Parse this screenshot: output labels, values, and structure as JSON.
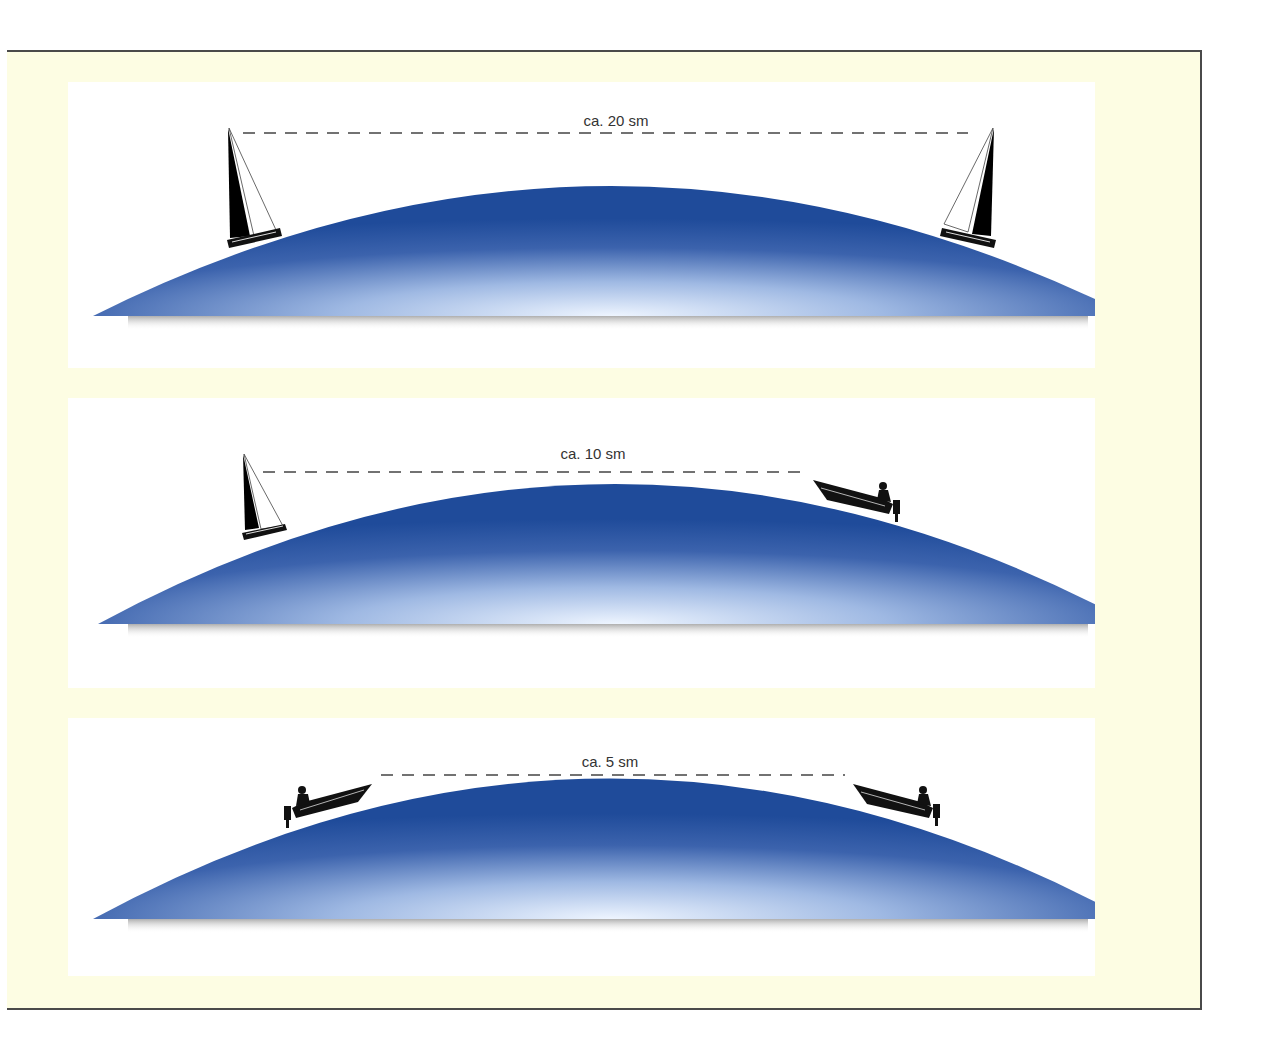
{
  "figure": {
    "type": "curvature-of-earth-visibility-diagram",
    "colors": {
      "frame_background": "#fdfde3",
      "frame_border": "#4a4a4a",
      "panel_background": "#ffffff",
      "sea_dark": "#1f4b9a",
      "sea_light": "#eaf2ff",
      "vessel": "#111111",
      "dash_line": "#444444"
    },
    "panels": [
      {
        "id": "panel-1",
        "label": "ca. 20 sm",
        "left_vessel": "sailboat",
        "right_vessel": "sailboat",
        "top": 82,
        "height": 286,
        "label_x": 548,
        "label_y": 30,
        "dash": {
          "x1": 175,
          "x2": 900,
          "y": 51
        },
        "dome": {
          "x1": 25,
          "x2": 1062,
          "base_y": 234,
          "peak_y": 104
        }
      },
      {
        "id": "panel-2",
        "label": "ca. 10 sm",
        "left_vessel": "sailboat",
        "right_vessel": "motorboat",
        "top": 398,
        "height": 290,
        "label_x": 525,
        "label_y": 47,
        "dash": {
          "x1": 195,
          "x2": 738,
          "y": 74
        },
        "dome": {
          "x1": 30,
          "x2": 1065,
          "base_y": 226,
          "peak_y": 86
        }
      },
      {
        "id": "panel-3",
        "label": "ca. 5 sm",
        "left_vessel": "motorboat",
        "right_vessel": "motorboat",
        "top": 718,
        "height": 258,
        "label_x": 542,
        "label_y": 35,
        "dash": {
          "x1": 313,
          "x2": 777,
          "y": 57
        },
        "dome": {
          "x1": 25,
          "x2": 1060,
          "base_y": 201,
          "peak_y": 60
        }
      }
    ]
  }
}
